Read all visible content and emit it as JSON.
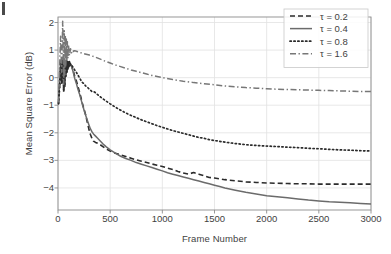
{
  "figure": {
    "background": "#ffffff",
    "frame_color": "#8c8c8c",
    "grid_color": "#e2e2e2",
    "text_color": "#3f3f3f"
  },
  "chart_data": {
    "type": "line",
    "title": "",
    "xlabel": "Frame Number",
    "ylabel": "Mean Square Error (dB)",
    "xlim": [
      0,
      3000
    ],
    "ylim": [
      -4.8,
      2.2
    ],
    "xticks": [
      0,
      500,
      1000,
      1500,
      2000,
      2500,
      3000
    ],
    "yticks": [
      2,
      1,
      0,
      -1,
      -2,
      -3,
      -4
    ],
    "xticklabels": [
      "0",
      "500",
      "1000",
      "1500",
      "2000",
      "2500",
      "3000"
    ],
    "yticklabels": [
      "2",
      "1",
      "0",
      "−1",
      "−2",
      "−3",
      "−4"
    ],
    "grid": true,
    "grid_axis": "both",
    "legend_position": "top-right",
    "legend_border": true,
    "series": [
      {
        "name": "τ = 0.2",
        "label": "τ = 0.2",
        "style": "dashed",
        "color": "#2b2b2b",
        "width": 1.6,
        "dasharray": "5,3",
        "x": [
          5,
          15,
          25,
          35,
          45,
          55,
          60,
          65,
          70,
          75,
          80,
          85,
          90,
          95,
          100,
          105,
          110,
          115,
          120,
          130,
          140,
          150,
          160,
          175,
          190,
          205,
          220,
          235,
          250,
          265,
          280,
          295,
          310,
          325,
          340,
          360,
          380,
          400,
          430,
          460,
          500,
          550,
          600,
          650,
          700,
          750,
          800,
          850,
          900,
          950,
          1000,
          1050,
          1100,
          1150,
          1200,
          1250,
          1300,
          1350,
          1400,
          1450,
          1500,
          1550,
          1600,
          1700,
          1800,
          1900,
          2000,
          2100,
          2200,
          2300,
          2400,
          2500,
          2600,
          2700,
          2800,
          2900,
          3000
        ],
        "y": [
          -0.95,
          -0.4,
          0.35,
          -0.2,
          0.55,
          -0.55,
          0.45,
          -0.35,
          0.5,
          0.05,
          0.55,
          0.2,
          0.6,
          0.3,
          0.62,
          0.4,
          0.58,
          0.45,
          0.5,
          0.42,
          0.3,
          0.2,
          0.05,
          -0.1,
          -0.3,
          -0.5,
          -0.72,
          -0.95,
          -1.15,
          -1.35,
          -1.6,
          -1.85,
          -2.05,
          -2.2,
          -2.3,
          -2.35,
          -2.38,
          -2.42,
          -2.5,
          -2.58,
          -2.66,
          -2.74,
          -2.8,
          -2.86,
          -2.92,
          -2.98,
          -3.03,
          -3.08,
          -3.13,
          -3.18,
          -3.22,
          -3.28,
          -3.33,
          -3.4,
          -3.46,
          -3.5,
          -3.44,
          -3.5,
          -3.56,
          -3.62,
          -3.64,
          -3.67,
          -3.7,
          -3.74,
          -3.78,
          -3.8,
          -3.82,
          -3.83,
          -3.84,
          -3.85,
          -3.85,
          -3.86,
          -3.86,
          -3.86,
          -3.86,
          -3.86,
          -3.86
        ]
      },
      {
        "name": "τ = 0.4",
        "label": "τ = 0.4",
        "style": "solid",
        "color": "#6b6b6b",
        "width": 1.5,
        "dasharray": "",
        "x": [
          5,
          15,
          25,
          35,
          45,
          55,
          60,
          65,
          70,
          75,
          80,
          85,
          90,
          95,
          100,
          105,
          110,
          115,
          120,
          130,
          140,
          150,
          160,
          175,
          190,
          205,
          220,
          235,
          250,
          265,
          280,
          295,
          310,
          325,
          340,
          360,
          380,
          400,
          430,
          460,
          500,
          550,
          600,
          650,
          700,
          750,
          800,
          850,
          900,
          950,
          1000,
          1050,
          1100,
          1150,
          1200,
          1250,
          1300,
          1350,
          1400,
          1450,
          1500,
          1550,
          1600,
          1700,
          1800,
          1900,
          2000,
          2100,
          2200,
          2300,
          2400,
          2500,
          2600,
          2700,
          2800,
          2900,
          3000
        ],
        "y": [
          -0.9,
          -0.2,
          0.6,
          -0.1,
          0.7,
          -0.4,
          0.55,
          -0.2,
          0.6,
          0.1,
          0.62,
          0.25,
          0.6,
          0.35,
          0.55,
          0.42,
          0.5,
          0.45,
          0.48,
          0.4,
          0.28,
          0.14,
          -0.02,
          -0.2,
          -0.4,
          -0.58,
          -0.78,
          -0.98,
          -1.18,
          -1.36,
          -1.54,
          -1.7,
          -1.85,
          -1.96,
          -2.04,
          -2.12,
          -2.2,
          -2.28,
          -2.4,
          -2.5,
          -2.62,
          -2.74,
          -2.85,
          -2.93,
          -3.0,
          -3.08,
          -3.14,
          -3.2,
          -3.26,
          -3.32,
          -3.38,
          -3.45,
          -3.5,
          -3.55,
          -3.6,
          -3.65,
          -3.7,
          -3.75,
          -3.8,
          -3.85,
          -3.9,
          -3.95,
          -4.0,
          -4.08,
          -4.16,
          -4.22,
          -4.28,
          -4.32,
          -4.36,
          -4.4,
          -4.44,
          -4.47,
          -4.5,
          -4.52,
          -4.54,
          -4.56,
          -4.58
        ]
      },
      {
        "name": "τ = 0.8",
        "label": "τ = 0.8",
        "style": "dotted",
        "color": "#2b2b2b",
        "width": 1.7,
        "dasharray": "1.3,2.6",
        "x": [
          5,
          15,
          25,
          35,
          45,
          55,
          60,
          65,
          70,
          75,
          80,
          85,
          90,
          95,
          100,
          105,
          110,
          115,
          120,
          130,
          140,
          150,
          160,
          175,
          190,
          205,
          220,
          235,
          250,
          265,
          280,
          300,
          325,
          350,
          375,
          400,
          450,
          500,
          550,
          600,
          650,
          700,
          750,
          800,
          850,
          900,
          950,
          1000,
          1050,
          1100,
          1150,
          1200,
          1250,
          1300,
          1350,
          1400,
          1450,
          1500,
          1600,
          1700,
          1800,
          1900,
          2000,
          2100,
          2200,
          2300,
          2400,
          2500,
          2600,
          2700,
          2800,
          2900,
          3000
        ],
        "y": [
          -0.95,
          -0.3,
          0.5,
          -0.15,
          0.65,
          -0.45,
          0.5,
          -0.3,
          0.55,
          0.05,
          0.6,
          0.2,
          0.6,
          0.3,
          0.58,
          0.4,
          0.55,
          0.45,
          0.5,
          0.46,
          0.4,
          0.34,
          0.28,
          0.2,
          0.1,
          0.0,
          -0.1,
          -0.18,
          -0.22,
          -0.3,
          -0.34,
          -0.42,
          -0.5,
          -0.52,
          -0.6,
          -0.68,
          -0.82,
          -0.95,
          -1.07,
          -1.18,
          -1.28,
          -1.37,
          -1.45,
          -1.53,
          -1.6,
          -1.67,
          -1.74,
          -1.8,
          -1.86,
          -1.92,
          -1.97,
          -2.02,
          -2.07,
          -2.12,
          -2.17,
          -2.2,
          -2.25,
          -2.28,
          -2.34,
          -2.39,
          -2.43,
          -2.46,
          -2.48,
          -2.5,
          -2.52,
          -2.54,
          -2.56,
          -2.58,
          -2.6,
          -2.62,
          -2.63,
          -2.65,
          -2.66
        ]
      },
      {
        "name": "τ = 1.6",
        "label": "τ = 1.6",
        "style": "dashdot",
        "color": "#777777",
        "width": 1.5,
        "dasharray": "6,2.5,1.4,2.5",
        "x": [
          5,
          15,
          25,
          35,
          45,
          55,
          60,
          65,
          70,
          75,
          80,
          85,
          90,
          95,
          100,
          110,
          120,
          130,
          140,
          150,
          160,
          175,
          190,
          205,
          220,
          240,
          260,
          280,
          300,
          330,
          360,
          400,
          450,
          500,
          550,
          600,
          650,
          700,
          750,
          800,
          850,
          900,
          950,
          1000,
          1100,
          1200,
          1300,
          1400,
          1500,
          1600,
          1700,
          1800,
          1900,
          2000,
          2100,
          2200,
          2300,
          2400,
          2500,
          2600,
          2700,
          2800,
          2900,
          3000
        ],
        "y": [
          -0.9,
          0.3,
          1.5,
          0.2,
          2.05,
          -0.25,
          1.7,
          0.1,
          1.55,
          0.45,
          1.4,
          0.6,
          1.3,
          0.7,
          1.2,
          0.8,
          1.05,
          0.9,
          1.0,
          0.95,
          0.98,
          0.96,
          0.94,
          0.92,
          0.9,
          0.88,
          0.86,
          0.84,
          0.82,
          0.78,
          0.74,
          0.68,
          0.6,
          0.53,
          0.46,
          0.4,
          0.34,
          0.28,
          0.23,
          0.18,
          0.13,
          0.08,
          0.04,
          0.0,
          -0.07,
          -0.13,
          -0.18,
          -0.22,
          -0.26,
          -0.3,
          -0.33,
          -0.36,
          -0.38,
          -0.4,
          -0.42,
          -0.43,
          -0.44,
          -0.45,
          -0.46,
          -0.47,
          -0.48,
          -0.49,
          -0.5,
          -0.5
        ]
      }
    ]
  }
}
